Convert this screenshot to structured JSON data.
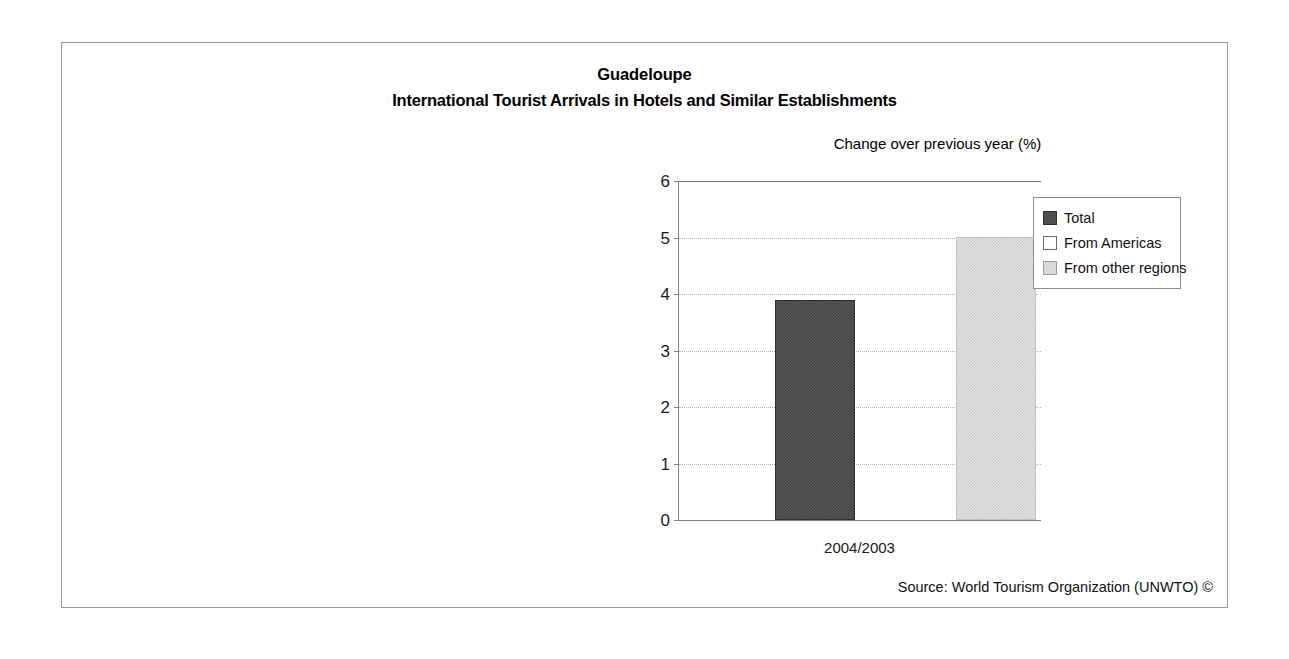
{
  "figure": {
    "title_main": "Guadeloupe",
    "title_sub": "International Tourist Arrivals in Hotels and Similar Establishments",
    "axis_caption": "Change over previous year (%)",
    "source_note": "Source: World Tourism Organization (UNWTO) ©",
    "frame_color": "#9a9a9a"
  },
  "legend": {
    "position": "top-right-inside-plot",
    "items": [
      {
        "label": "Total",
        "swatch": "dark-checker-swatch",
        "color": "#5a5a5a"
      },
      {
        "label": "From Americas",
        "swatch": "white-swatch",
        "color": "#ffffff"
      },
      {
        "label": "From other regions",
        "swatch": "light-checker-swatch",
        "color": "#e4e4e4"
      }
    ]
  },
  "chart_data": {
    "type": "bar",
    "subtitle": "Change over previous year (%)",
    "xlabel": "",
    "ylabel": "Change over previous year (%)",
    "categories": [
      "2004/2003"
    ],
    "series": [
      {
        "name": "Total",
        "values": [
          3.9
        ],
        "color": "#5a5a5a"
      },
      {
        "name": "From Americas",
        "values": [
          0.0
        ],
        "color": "#ffffff"
      },
      {
        "name": "From other regions",
        "values": [
          5.0
        ],
        "color": "#e4e4e4"
      }
    ],
    "ylim": [
      0,
      6
    ],
    "yticks": [
      0,
      1,
      2,
      3,
      4,
      5,
      6
    ],
    "ytick_labels": [
      "0",
      "1",
      "2",
      "3",
      "4",
      "5",
      "6"
    ],
    "grid": true,
    "grid_orientation": "horizontal",
    "grid_style": "dotted",
    "legend_position": "top-right"
  }
}
